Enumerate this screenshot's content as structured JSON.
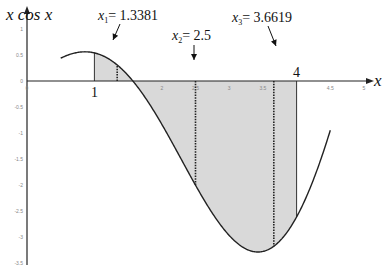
{
  "chart_data": {
    "type": "area",
    "title": "",
    "ylabel": "x cos x",
    "xlabel": "x",
    "function": "x*cos(x)",
    "xlim": [
      0,
      5
    ],
    "ylim": [
      -3.5,
      1
    ],
    "curve_domain": [
      0.5,
      4.5
    ],
    "shaded_interval": [
      1,
      4
    ],
    "grid": false,
    "x_ticks": [
      {
        "value": 0,
        "label": "0"
      },
      {
        "value": 1,
        "label": "1"
      },
      {
        "value": 2,
        "label": "2"
      },
      {
        "value": 2.5,
        "label": "2.5"
      },
      {
        "value": 3,
        "label": "3"
      },
      {
        "value": 3.5,
        "label": "3.5"
      },
      {
        "value": 4,
        "label": "4"
      },
      {
        "value": 4.5,
        "label": "4.5"
      },
      {
        "value": 5,
        "label": "5"
      }
    ],
    "y_ticks": [
      {
        "value": 1,
        "label": "1"
      },
      {
        "value": 0.5,
        "label": "0.5"
      },
      {
        "value": 0,
        "label": "0"
      },
      {
        "value": -0.5,
        "label": "-0.5"
      },
      {
        "value": -1,
        "label": "-1"
      },
      {
        "value": -1.5,
        "label": "-1.5"
      },
      {
        "value": -2,
        "label": "-2"
      },
      {
        "value": -2.5,
        "label": "-2.5"
      },
      {
        "value": -3,
        "label": "-3"
      },
      {
        "value": -3.5,
        "label": "-3.5"
      }
    ],
    "big_labels": [
      {
        "value": 1,
        "label": "1"
      },
      {
        "value": 4,
        "label": "4"
      }
    ],
    "solid_lines": [
      1,
      4
    ],
    "dotted_lines": [
      1.3381,
      2.5,
      3.6619
    ],
    "annotations": [
      {
        "name": "x1",
        "sym": "x",
        "sub": "1",
        "text": "= 1.3381",
        "x": 1.3381
      },
      {
        "name": "x2",
        "sym": "x",
        "sub": "2",
        "text": "= 2.5",
        "x": 2.5
      },
      {
        "name": "x3",
        "sym": "x",
        "sub": "3",
        "text": "= 3.6619",
        "x": 3.6619
      }
    ],
    "colors": {
      "shade": "#d9d9d9",
      "curve": "#222222",
      "axis": "#222222"
    }
  }
}
